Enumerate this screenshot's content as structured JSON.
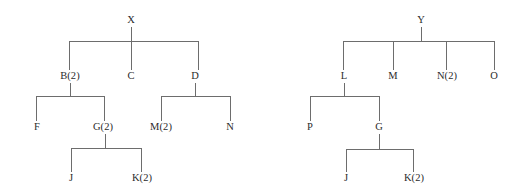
{
  "figure": {
    "title": "",
    "type": "tree-diagram-pair",
    "background_color": "#ffffff",
    "line_color": "#6d6d6d",
    "text_color": "#2b2b2b"
  },
  "trees": [
    {
      "id": "tree-x",
      "root": "X",
      "nodes": [
        {
          "id": "X",
          "label": "X",
          "x": 131,
          "y": 25,
          "level": 0
        },
        {
          "id": "B",
          "label": "B(2)",
          "x": 70,
          "y": 80,
          "level": 1
        },
        {
          "id": "C",
          "label": "C",
          "x": 131,
          "y": 80,
          "level": 1
        },
        {
          "id": "D",
          "label": "D",
          "x": 195,
          "y": 80,
          "level": 1
        },
        {
          "id": "F",
          "label": "F",
          "x": 37,
          "y": 131,
          "level": 2
        },
        {
          "id": "G",
          "label": "G(2)",
          "x": 102,
          "y": 131,
          "level": 2
        },
        {
          "id": "M",
          "label": "M(2)",
          "x": 161,
          "y": 131,
          "level": 2
        },
        {
          "id": "N",
          "label": "N",
          "x": 230,
          "y": 131,
          "level": 2
        },
        {
          "id": "J",
          "label": "J",
          "x": 71,
          "y": 182,
          "level": 3
        },
        {
          "id": "K",
          "label": "K(2)",
          "x": 141,
          "y": 182,
          "level": 3
        }
      ],
      "edges": [
        {
          "parent": "X",
          "children": [
            "B",
            "C",
            "D"
          ]
        },
        {
          "parent": "B",
          "children": [
            "F",
            "G"
          ]
        },
        {
          "parent": "D",
          "children": [
            "M",
            "N"
          ]
        },
        {
          "parent": "G",
          "children": [
            "J",
            "K"
          ]
        }
      ]
    },
    {
      "id": "tree-y",
      "root": "Y",
      "nodes": [
        {
          "id": "Y",
          "label": "Y",
          "x": 421,
          "y": 25,
          "level": 0
        },
        {
          "id": "L",
          "label": "L",
          "x": 344,
          "y": 80,
          "level": 1
        },
        {
          "id": "M2",
          "label": "M",
          "x": 393,
          "y": 80,
          "level": 1
        },
        {
          "id": "N2",
          "label": "N(2)",
          "x": 447,
          "y": 80,
          "level": 1
        },
        {
          "id": "O",
          "label": "O",
          "x": 494,
          "y": 80,
          "level": 1
        },
        {
          "id": "P",
          "label": "P",
          "x": 310,
          "y": 131,
          "level": 2
        },
        {
          "id": "G2",
          "label": "G",
          "x": 379,
          "y": 131,
          "level": 2
        },
        {
          "id": "J2",
          "label": "J",
          "x": 346,
          "y": 182,
          "level": 3
        },
        {
          "id": "K2",
          "label": "K(2)",
          "x": 413,
          "y": 182,
          "level": 3
        }
      ],
      "edges": [
        {
          "parent": "Y",
          "children": [
            "L",
            "M2",
            "N2",
            "O"
          ]
        },
        {
          "parent": "L",
          "children": [
            "P",
            "G2"
          ]
        },
        {
          "parent": "G2",
          "children": [
            "J2",
            "K2"
          ]
        }
      ]
    }
  ],
  "labels": {
    "tree_x_root": "X",
    "tree_x_b": "B(2)",
    "tree_x_c": "C",
    "tree_x_d": "D",
    "tree_x_f": "F",
    "tree_x_g": "G(2)",
    "tree_x_m": "M(2)",
    "tree_x_n": "N",
    "tree_x_j": "J",
    "tree_x_k": "K(2)",
    "tree_y_root": "Y",
    "tree_y_l": "L",
    "tree_y_m": "M",
    "tree_y_n": "N(2)",
    "tree_y_o": "O",
    "tree_y_p": "P",
    "tree_y_g": "G",
    "tree_y_j": "J",
    "tree_y_k": "K(2)"
  }
}
